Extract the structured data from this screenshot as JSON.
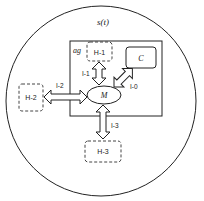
{
  "diagram": {
    "environment": {
      "label": "s(t)",
      "shape": "circle"
    },
    "agent": {
      "label": "ag",
      "shape": "rectangle"
    },
    "nodes": [
      {
        "id": "H-1",
        "label": "H-1",
        "style": "dashed",
        "inside_agent": true
      },
      {
        "id": "C",
        "label": "C",
        "style": "solid-rounded",
        "inside_agent": true
      },
      {
        "id": "M",
        "label": "M",
        "style": "ellipse",
        "inside_agent": true
      },
      {
        "id": "H-2",
        "label": "H-2",
        "style": "dashed",
        "inside_agent": false
      },
      {
        "id": "H-3",
        "label": "H-3",
        "style": "dashed",
        "inside_agent": false
      }
    ],
    "edges": [
      {
        "id": "I-0",
        "label": "I-0",
        "from": "M",
        "to": "C",
        "direction": "bidirectional"
      },
      {
        "id": "I-1",
        "label": "I-1",
        "from": "H-1",
        "to": "M",
        "direction": "bidirectional"
      },
      {
        "id": "I-2",
        "label": "I-2",
        "from": "H-2",
        "to": "M",
        "direction": "bidirectional"
      },
      {
        "id": "I-3",
        "label": "I-3",
        "from": "M",
        "to": "H-3",
        "direction": "bidirectional"
      }
    ],
    "colors": {
      "stroke": "#222222",
      "dashed_stroke": "#444444",
      "text": "#222222",
      "background": "#ffffff"
    }
  },
  "labels": {
    "environment": "s(t)",
    "agent": "ag",
    "h1": "H-1",
    "h2": "H-2",
    "h3": "H-3",
    "c": "C",
    "m": "M",
    "i0": "I-0",
    "i1": "I-1",
    "i2": "I-2",
    "i3": "I-3"
  }
}
